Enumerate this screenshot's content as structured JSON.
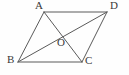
{
  "figure": {
    "kind": "geometry-diagram",
    "shape": "parallelogram",
    "background_color": "#fefefe",
    "stroke_color": "#5a5a5a",
    "label_color": "#3a3a3a",
    "stroke_width": 1,
    "labels": {
      "a": "A",
      "b": "B",
      "c": "C",
      "d": "D",
      "o": "O"
    },
    "points": {
      "A": {
        "x": 44,
        "y": 12
      },
      "B": {
        "x": 18,
        "y": 62
      },
      "C": {
        "x": 82,
        "y": 62
      },
      "D": {
        "x": 107,
        "y": 12
      },
      "O": {
        "x": 62.5,
        "y": 37
      }
    },
    "label_positions": {
      "A": {
        "x": 35,
        "y": 0
      },
      "B": {
        "x": 7,
        "y": 54
      },
      "C": {
        "x": 85,
        "y": 55
      },
      "D": {
        "x": 110,
        "y": 0
      },
      "O": {
        "x": 57,
        "y": 37
      }
    },
    "segments": [
      {
        "name": "side-AD",
        "from": "A",
        "to": "D"
      },
      {
        "name": "side-AB",
        "from": "A",
        "to": "B"
      },
      {
        "name": "side-BC",
        "from": "B",
        "to": "C"
      },
      {
        "name": "side-CD",
        "from": "C",
        "to": "D"
      },
      {
        "name": "diagonal-AC",
        "from": "A",
        "to": "C"
      },
      {
        "name": "diagonal-BD",
        "from": "B",
        "to": "D"
      }
    ]
  }
}
